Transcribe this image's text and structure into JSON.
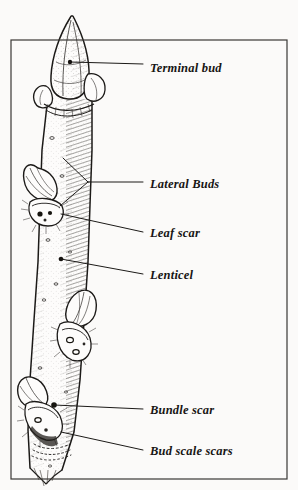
{
  "figure": {
    "kind": "botanical-line-illustration",
    "width": 298,
    "height": 490,
    "background_color": "#fbfaf9",
    "ink_color": "#171514",
    "frame": {
      "name": "border-rectangle",
      "x": 11,
      "y": 40,
      "width": 276,
      "height": 439,
      "stroke_color": "#3a3734",
      "stroke_width": 1.2
    }
  },
  "labels": [
    {
      "id": "terminal-bud",
      "text": "Terminal bud",
      "text_x": 150,
      "text_y": 70,
      "leader": {
        "x1": 70,
        "y1": 62,
        "x2": 143,
        "y2": 64,
        "dot": true,
        "dot_x": 70,
        "dot_y": 62
      }
    },
    {
      "id": "lateral-buds",
      "text": "Lateral Buds",
      "text_x": 150,
      "text_y": 186,
      "leader": {
        "x1": 88,
        "y1": 182,
        "x2": 143,
        "y2": 182,
        "dot": false
      },
      "fork": [
        {
          "x1": 88,
          "y1": 182,
          "x2": 63,
          "y2": 158
        },
        {
          "x1": 88,
          "y1": 182,
          "x2": 60,
          "y2": 206
        }
      ]
    },
    {
      "id": "leaf-scar",
      "text": "Leaf scar",
      "text_x": 150,
      "text_y": 235,
      "leader": {
        "x1": 61,
        "y1": 214,
        "x2": 143,
        "y2": 232,
        "dot": false
      }
    },
    {
      "id": "lenticel",
      "text": "Lenticel",
      "text_x": 150,
      "text_y": 277,
      "leader": {
        "x1": 61,
        "y1": 259,
        "x2": 143,
        "y2": 274,
        "dot": true,
        "dot_x": 61,
        "dot_y": 259
      }
    },
    {
      "id": "bundle-scar",
      "text": "Bundle scar",
      "text_x": 150,
      "text_y": 412,
      "leader": {
        "x1": 54,
        "y1": 405,
        "x2": 143,
        "y2": 409,
        "dot": false
      }
    },
    {
      "id": "bud-scale-scars",
      "text": "Bud scale scars",
      "text_x": 150,
      "text_y": 453,
      "leader": {
        "x1": 61,
        "y1": 432,
        "x2": 143,
        "y2": 450,
        "dot": false
      }
    }
  ],
  "structures": {
    "terminal_bud": "pointed conical bud at twig apex with stippled shading",
    "lateral_buds": "smaller ovate buds set at nodes along the stem",
    "leaf_scar": "crescent-shaped scar below each lateral bud",
    "lenticel": "small dark pore on the bark surface",
    "bundle_scar": "dark dots inside the leaf scar",
    "bud_scale_scars": "rings of fine dashes encircling the twig near the base"
  }
}
